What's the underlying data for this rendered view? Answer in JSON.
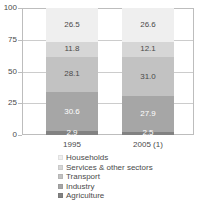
{
  "chart_data": {
    "type": "bar",
    "subtype": "stacked-100-percent",
    "title": "",
    "subtitle": "",
    "xlabel": "",
    "ylabel": "",
    "categories": [
      "1995",
      "2005 (1)"
    ],
    "ylim": [
      0,
      100
    ],
    "yticks": [
      0,
      25,
      50,
      75,
      100
    ],
    "ytick_labels": [
      "0",
      "25",
      "50",
      "75",
      "100"
    ],
    "grid": true,
    "legend_position": "bottom",
    "stack_order_bottom_to_top": [
      "Agriculture",
      "Industry",
      "Transport",
      "Services & other sectors",
      "Households"
    ],
    "series": [
      {
        "name": "Households",
        "color": "#efefef",
        "values": [
          26.5,
          26.6
        ],
        "labels": [
          "26.5",
          "26.6"
        ],
        "label_color": "#4a4a4a"
      },
      {
        "name": "Services & other sectors",
        "color": "#d6d6d6",
        "values": [
          11.8,
          12.1
        ],
        "labels": [
          "11.8",
          "12.1"
        ],
        "label_color": "#4a4a4a"
      },
      {
        "name": "Transport",
        "color": "#c2c2c2",
        "values": [
          28.1,
          31.0
        ],
        "labels": [
          "28.1",
          "31.0"
        ],
        "label_color": "#4a4a4a"
      },
      {
        "name": "Industry",
        "color": "#a6a6a6",
        "values": [
          30.6,
          27.9
        ],
        "labels": [
          "30.6",
          "27.9"
        ],
        "label_color": "#ffffff"
      },
      {
        "name": "Agriculture",
        "color": "#828282",
        "values": [
          2.9,
          2.5
        ],
        "labels": [
          "2.9",
          "2.5"
        ],
        "label_color": "#ffffff"
      }
    ]
  },
  "axes": {
    "y_ticks": [
      {
        "label": "100",
        "value": 100
      },
      {
        "label": "75",
        "value": 75
      },
      {
        "label": "50",
        "value": 50
      },
      {
        "label": "25",
        "value": 25
      },
      {
        "label": "0",
        "value": 0
      }
    ],
    "x_ticks": [
      {
        "label": "1995"
      },
      {
        "label": "2005 (1)"
      }
    ]
  },
  "legend": {
    "items": [
      {
        "label": "Households",
        "color": "#efefef"
      },
      {
        "label": "Services & other sectors",
        "color": "#d6d6d6"
      },
      {
        "label": "Transport",
        "color": "#c2c2c2"
      },
      {
        "label": "Industry",
        "color": "#a6a6a6"
      },
      {
        "label": "Agriculture",
        "color": "#828282"
      }
    ]
  }
}
